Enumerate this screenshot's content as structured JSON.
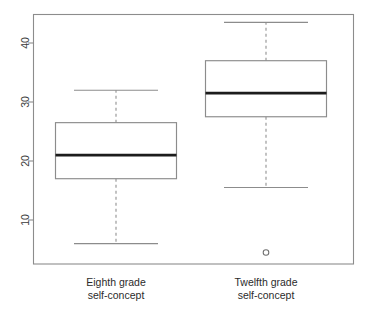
{
  "chart_data": {
    "type": "box",
    "title": "",
    "xlabel": "",
    "ylabel": "",
    "ylim": [
      3,
      45
    ],
    "grid": false,
    "legend": "none",
    "y_ticks": [
      10,
      20,
      30,
      40
    ],
    "y_tick_labels": [
      "10",
      "20",
      "30",
      "40"
    ],
    "categories": [
      "Eighth grade self-concept",
      "Twelfth grade self-concept"
    ],
    "category_label_lines": [
      [
        "Eighth grade",
        "self-concept"
      ],
      [
        "Twelfth grade",
        "self-concept"
      ]
    ],
    "boxes": [
      {
        "name": "Eighth grade self-concept",
        "whisker_low": 6,
        "q1": 17,
        "median": 21,
        "q3": 26.5,
        "whisker_high": 32,
        "outliers": []
      },
      {
        "name": "Twelfth grade self-concept",
        "whisker_low": 15.5,
        "q1": 27.5,
        "median": 31.5,
        "q3": 37,
        "whisker_high": 43.5,
        "outliers": [
          4.5
        ]
      }
    ]
  },
  "style": {
    "background": "#ffffff",
    "frame_color": "#8c8c8c",
    "box_color": "#8c8c8c",
    "median_color": "#1c1c1c",
    "text_color": "#2b2b2b"
  }
}
